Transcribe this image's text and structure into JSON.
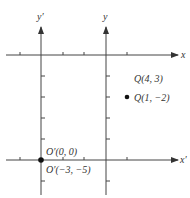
{
  "diagram": {
    "title": "",
    "colors": {
      "line": "#444444",
      "text": "#333333",
      "point": "#111111"
    },
    "axes": {
      "x": {
        "label": "x"
      },
      "y": {
        "label": "y"
      },
      "x_prime": {
        "label": "x′"
      },
      "y_prime": {
        "label": "y′"
      }
    },
    "points": [
      {
        "id": "Q",
        "label_new": "Q(4, 3)",
        "label_old": "Q(1, −2)"
      },
      {
        "id": "O-prime",
        "label_new": "O′(0, 0)",
        "label_old": "O′(−3, −5)"
      }
    ]
  }
}
